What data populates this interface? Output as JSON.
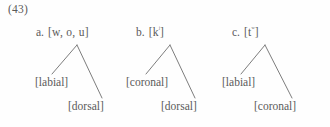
{
  "figure": {
    "example_number": "(43)",
    "background_color": "#fefefe",
    "text_color": "#5a5a5a",
    "line_color": "#6e6e6e"
  },
  "trees": [
    {
      "letter": "a.",
      "segment": "[w, o, u]",
      "segment_superscript": "",
      "left_node": "[labial]",
      "right_node": "[dorsal]"
    },
    {
      "letter": "b.",
      "segment_prefix": "[k",
      "segment_superscript": "ʲ",
      "segment_suffix": "]",
      "left_node": "[coronal]",
      "right_node": "[dorsal]"
    },
    {
      "letter": "c.",
      "segment_prefix": "[t",
      "segment_superscript": "ʷ",
      "segment_suffix": "]",
      "left_node": "[labial]",
      "right_node": "[coronal]"
    }
  ]
}
